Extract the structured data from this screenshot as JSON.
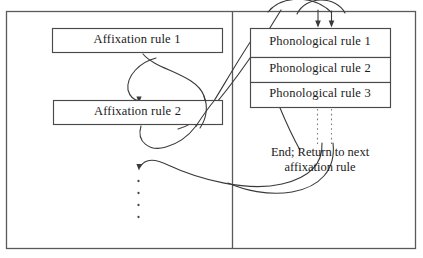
{
  "figure": {
    "frame": {
      "stroke": "#5a5a5a",
      "fill": "#ffffff"
    },
    "divider": {
      "stroke": "#5a5a5a"
    },
    "flow_stroke": "#3a3a3a",
    "dotted_stroke": "#7a7a7a"
  },
  "left_column": {
    "name": "affixation-rules",
    "boxes": [
      {
        "id": "affixation-rule-1",
        "label": "Affixation rule 1"
      },
      {
        "id": "affixation-rule-2",
        "label": "Affixation rule 2"
      }
    ],
    "continuation": "vertical-dots"
  },
  "right_column": {
    "name": "phonological-rules",
    "boxes": [
      {
        "id": "phonological-rule-1",
        "label": "Phonological rule 1"
      },
      {
        "id": "phonological-rule-2",
        "label": "Phonological rule 2"
      },
      {
        "id": "phonological-rule-3",
        "label": "Phonological rule 3"
      }
    ],
    "end_note": {
      "line1": "End; Return to next",
      "line2": "affixation rule"
    }
  },
  "arrows": {
    "entry_arrow_left": "down-arrow-into-phonological-block",
    "entry_arrow_right": "down-arrow-into-phonological-block",
    "loop_to_affixation_2": "arrow-into-affixation-rule-2",
    "loop_to_next_affixation": "arrow-into-next-affixation-rule"
  }
}
